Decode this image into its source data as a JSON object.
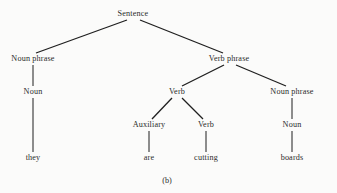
{
  "figure": {
    "caption": "(b)",
    "caption_x": 167,
    "caption_y": 180,
    "width": 337,
    "height": 193,
    "background_color": "#fbfbfa",
    "line_color": "#1f1f1f",
    "text_color": "#2b2b2b"
  },
  "tree_data": {
    "type": "syntax-tree",
    "sentence": "they are cutting boards",
    "nodes": [
      {
        "id": "sentence",
        "label": "Sentence",
        "x": 133,
        "y": 14,
        "kind": "nonterminal"
      },
      {
        "id": "np-left",
        "label": "Noun phrase",
        "x": 33,
        "y": 59,
        "kind": "nonterminal"
      },
      {
        "id": "vp",
        "label": "Verb phrase",
        "x": 229,
        "y": 59,
        "kind": "nonterminal"
      },
      {
        "id": "noun-left",
        "label": "Noun",
        "x": 33,
        "y": 92,
        "kind": "nonterminal"
      },
      {
        "id": "verb-upper",
        "label": "Verb",
        "x": 177,
        "y": 92,
        "kind": "nonterminal"
      },
      {
        "id": "np-right",
        "label": "Noun phrase",
        "x": 292,
        "y": 92,
        "kind": "nonterminal"
      },
      {
        "id": "auxiliary",
        "label": "Auxiliary",
        "x": 149,
        "y": 125,
        "kind": "nonterminal"
      },
      {
        "id": "verb-lower",
        "label": "Verb",
        "x": 206,
        "y": 125,
        "kind": "nonterminal"
      },
      {
        "id": "noun-right",
        "label": "Noun",
        "x": 292,
        "y": 125,
        "kind": "nonterminal"
      },
      {
        "id": "word-they",
        "label": "they",
        "x": 33,
        "y": 158,
        "kind": "terminal"
      },
      {
        "id": "word-are",
        "label": "are",
        "x": 149,
        "y": 158,
        "kind": "terminal"
      },
      {
        "id": "word-cutting",
        "label": "cutting",
        "x": 206,
        "y": 158,
        "kind": "terminal"
      },
      {
        "id": "word-boards",
        "label": "boards",
        "x": 292,
        "y": 158,
        "kind": "terminal"
      }
    ],
    "edges": [
      {
        "id": "edge-sentence-np-left",
        "from": "sentence",
        "to": "np-left",
        "x1": 127,
        "y1": 20,
        "x2": 36,
        "y2": 53
      },
      {
        "id": "edge-sentence-vp",
        "from": "sentence",
        "to": "vp",
        "x1": 140,
        "y1": 20,
        "x2": 223,
        "y2": 53
      },
      {
        "id": "edge-np-left-noun",
        "from": "np-left",
        "to": "noun-left",
        "x1": 33,
        "y1": 65,
        "x2": 33,
        "y2": 86
      },
      {
        "id": "edge-noun-they",
        "from": "noun-left",
        "to": "word-they",
        "x1": 33,
        "y1": 98,
        "x2": 33,
        "y2": 152
      },
      {
        "id": "edge-vp-verb",
        "from": "vp",
        "to": "verb-upper",
        "x1": 224,
        "y1": 65,
        "x2": 182,
        "y2": 86
      },
      {
        "id": "edge-vp-np-right",
        "from": "vp",
        "to": "np-right",
        "x1": 236,
        "y1": 65,
        "x2": 286,
        "y2": 86
      },
      {
        "id": "edge-verb-auxiliary",
        "from": "verb-upper",
        "to": "auxiliary",
        "x1": 172,
        "y1": 98,
        "x2": 152,
        "y2": 119
      },
      {
        "id": "edge-verb-verb-lower",
        "from": "verb-upper",
        "to": "verb-lower",
        "x1": 182,
        "y1": 98,
        "x2": 203,
        "y2": 119
      },
      {
        "id": "edge-np-right-noun-right",
        "from": "np-right",
        "to": "noun-right",
        "x1": 292,
        "y1": 98,
        "x2": 292,
        "y2": 119
      },
      {
        "id": "edge-auxiliary-are",
        "from": "auxiliary",
        "to": "word-are",
        "x1": 149,
        "y1": 131,
        "x2": 149,
        "y2": 152
      },
      {
        "id": "edge-verb-lower-cutting",
        "from": "verb-lower",
        "to": "word-cutting",
        "x1": 206,
        "y1": 131,
        "x2": 206,
        "y2": 152
      },
      {
        "id": "edge-noun-right-boards",
        "from": "noun-right",
        "to": "word-boards",
        "x1": 292,
        "y1": 131,
        "x2": 292,
        "y2": 152
      }
    ]
  }
}
